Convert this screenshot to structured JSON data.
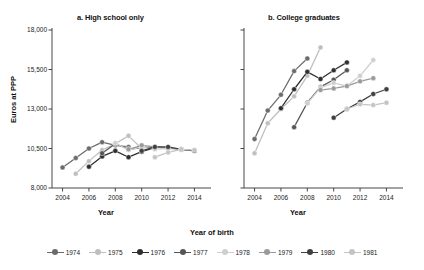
{
  "figure": {
    "ylabel": "Euros at PPP",
    "xlabel_a": "Year",
    "xlabel_b": "Year",
    "panel_a_title": "a. High school only",
    "panel_b_title": "b. College graduates",
    "legend_title": "Year of birth"
  },
  "axes": {
    "yticks": [
      "8,000",
      "10,500",
      "13,000",
      "15,500",
      "18,000"
    ],
    "ytick_values": [
      8000,
      10500,
      13000,
      15500,
      18000
    ],
    "xticks": [
      "2004",
      "2006",
      "2008",
      "2010",
      "2012",
      "2014"
    ],
    "xtick_values": [
      2004,
      2006,
      2008,
      2010,
      2012,
      2014
    ],
    "ylim": [
      8000,
      18000
    ],
    "xlim": [
      2003.2,
      2014.8
    ],
    "grid": false
  },
  "colors": {
    "c1974": "#6b6b6b",
    "c1975": "#bfbfbf",
    "c1976": "#2e2e2e",
    "c1977": "#555555",
    "c1978": "#cfcfcf",
    "c1979": "#9a9a9a",
    "c1980": "#3f3f3f",
    "c1981": "#c4c4c4"
  },
  "chart_data": [
    {
      "type": "line",
      "title": "a. High school only",
      "xlabel": "Year",
      "ylabel": "Euros at PPP",
      "xlim": [
        2003.2,
        2014.8
      ],
      "ylim": [
        8000,
        18000
      ],
      "grid": false,
      "legend_position": "bottom",
      "legend_title": "Year of birth",
      "series": [
        {
          "name": "1974",
          "x": [
            2004,
            2005,
            2006,
            2007,
            2008,
            2009
          ],
          "values": [
            9300,
            9900,
            10500,
            10900,
            10700,
            10600
          ]
        },
        {
          "name": "1975",
          "x": [
            2005,
            2006,
            2007,
            2008,
            2009,
            2010
          ],
          "values": [
            8900,
            9700,
            10400,
            10800,
            11300,
            10500
          ]
        },
        {
          "name": "1976",
          "x": [
            2006,
            2007,
            2008,
            2009,
            2010,
            2011
          ],
          "values": [
            9350,
            10000,
            10350,
            9950,
            10300,
            10550
          ]
        },
        {
          "name": "1977",
          "x": [
            2007,
            2008,
            2009,
            2010,
            2011,
            2012
          ],
          "values": [
            10200,
            10800,
            10450,
            10550,
            10600,
            10500
          ]
        },
        {
          "name": "1978",
          "x": [
            2008,
            2009,
            2010,
            2011,
            2012,
            2013
          ],
          "values": [
            10850,
            10400,
            10600,
            10450,
            10500,
            10400
          ]
        },
        {
          "name": "1979",
          "x": [
            2009,
            2010,
            2011,
            2012,
            2013,
            2014
          ],
          "values": [
            10450,
            10700,
            10600,
            10550,
            10450,
            10350
          ]
        },
        {
          "name": "1980",
          "x": [
            2010,
            2011,
            2012,
            2013,
            2014
          ],
          "values": [
            10350,
            10600,
            10600,
            10450,
            10350
          ]
        },
        {
          "name": "1981",
          "x": [
            2011,
            2012,
            2013,
            2014
          ],
          "values": [
            9950,
            10250,
            10450,
            10400
          ]
        }
      ]
    },
    {
      "type": "line",
      "title": "b. College graduates",
      "xlabel": "Year",
      "ylabel": "Euros at PPP",
      "xlim": [
        2003.2,
        2014.8
      ],
      "ylim": [
        8000,
        18000
      ],
      "grid": false,
      "legend_position": "bottom",
      "legend_title": "Year of birth",
      "series": [
        {
          "name": "1974",
          "x": [
            2004,
            2005,
            2006,
            2007,
            2008
          ],
          "values": [
            11100,
            12900,
            13900,
            15400,
            16200
          ]
        },
        {
          "name": "1975",
          "x": [
            2004,
            2005,
            2006,
            2007,
            2008,
            2009
          ],
          "values": [
            10200,
            12100,
            13000,
            13800,
            15100,
            16900
          ]
        },
        {
          "name": "1976",
          "x": [
            2006,
            2007,
            2008,
            2009,
            2010,
            2011
          ],
          "values": [
            13050,
            14250,
            15350,
            14900,
            15450,
            15950
          ]
        },
        {
          "name": "1977",
          "x": [
            2007,
            2008,
            2009,
            2010,
            2011
          ],
          "values": [
            11850,
            13400,
            14400,
            14850,
            15450
          ]
        },
        {
          "name": "1978",
          "x": [
            2008,
            2009,
            2010,
            2011,
            2012,
            2013
          ],
          "values": [
            13350,
            14350,
            14650,
            14450,
            15100,
            16100
          ]
        },
        {
          "name": "1979",
          "x": [
            2009,
            2010,
            2011,
            2012,
            2013
          ],
          "values": [
            14200,
            14300,
            14450,
            14750,
            14950
          ]
        },
        {
          "name": "1980",
          "x": [
            2010,
            2011,
            2012,
            2013,
            2014
          ],
          "values": [
            12450,
            13000,
            13450,
            13950,
            14250
          ]
        },
        {
          "name": "1981",
          "x": [
            2011,
            2012,
            2013,
            2014
          ],
          "values": [
            13000,
            13300,
            13250,
            13400
          ]
        }
      ]
    }
  ],
  "legend": {
    "items": [
      {
        "label": "1974",
        "color_key": "c1974"
      },
      {
        "label": "1975",
        "color_key": "c1975"
      },
      {
        "label": "1976",
        "color_key": "c1976"
      },
      {
        "label": "1977",
        "color_key": "c1977"
      },
      {
        "label": "1978",
        "color_key": "c1978"
      },
      {
        "label": "1979",
        "color_key": "c1979"
      },
      {
        "label": "1980",
        "color_key": "c1980"
      },
      {
        "label": "1981",
        "color_key": "c1981"
      }
    ]
  }
}
